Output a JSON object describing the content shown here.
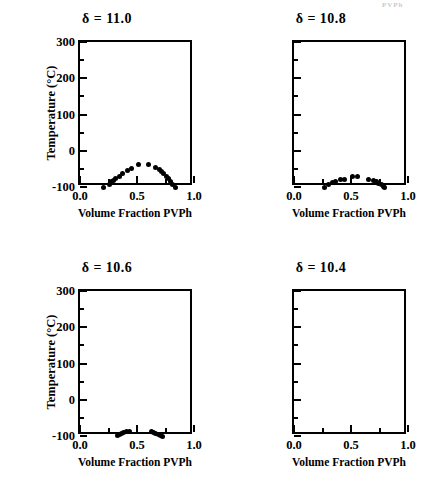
{
  "figure": {
    "artifact_text": "PVPh",
    "shared_xlabel": "Volume  Fraction  PVPh",
    "shared_ylabel": "Temperature  (°C)"
  },
  "chart_data": [
    {
      "type": "scatter",
      "title": "δ  =  11.0",
      "delta": "11.0",
      "xlabel": "Volume  Fraction  PVPh",
      "ylabel": "Temperature  (°C)",
      "xlim": [
        0.0,
        1.0
      ],
      "ylim": [
        -100,
        300
      ],
      "xticks": [
        0.0,
        0.5,
        1.0
      ],
      "xtick_labels": [
        "0.0",
        "0.5",
        "1.0"
      ],
      "xminor": [
        0.25,
        0.75
      ],
      "yticks": [
        -100,
        0,
        100,
        200,
        300
      ],
      "ytick_labels": [
        "-100",
        "0",
        "100",
        "200",
        "300"
      ],
      "yminor": [
        -50,
        50,
        150,
        250
      ],
      "grid": false,
      "legend": null,
      "x": [
        0.205,
        0.255,
        0.275,
        0.295,
        0.315,
        0.345,
        0.375,
        0.415,
        0.455,
        0.515,
        0.605,
        0.665,
        0.695,
        0.715,
        0.735,
        0.755,
        0.775,
        0.795,
        0.815,
        0.835
      ],
      "y": [
        -100,
        -93,
        -86,
        -82,
        -77,
        -70,
        -62,
        -55,
        -50,
        -38,
        -38,
        -46,
        -52,
        -58,
        -64,
        -70,
        -77,
        -84,
        -92,
        -100
      ]
    },
    {
      "type": "scatter",
      "title": "δ  =  10.8",
      "delta": "10.8",
      "xlabel": "Volume  Fraction  PVPh",
      "ylabel": "Temperature  (°C)",
      "xlim": [
        0.0,
        1.0
      ],
      "ylim": [
        -100,
        300
      ],
      "xticks": [
        0.0,
        0.5,
        1.0
      ],
      "xtick_labels": [
        "0.0",
        "0.5",
        "1.0"
      ],
      "xminor": [
        0.25,
        0.75
      ],
      "yticks": [
        -100,
        0,
        100,
        200,
        300
      ],
      "ytick_labels": [
        "-100",
        "0",
        "100",
        "200",
        "300"
      ],
      "yminor": [
        -50,
        50,
        150,
        250
      ],
      "grid": false,
      "legend": null,
      "x": [
        0.265,
        0.305,
        0.335,
        0.365,
        0.405,
        0.445,
        0.515,
        0.555,
        0.655,
        0.695,
        0.725,
        0.745,
        0.765,
        0.785,
        0.795
      ],
      "y": [
        -100,
        -94,
        -88,
        -85,
        -80,
        -78,
        -72,
        -71,
        -78,
        -82,
        -86,
        -90,
        -94,
        -98,
        -100
      ]
    },
    {
      "type": "scatter",
      "title": "δ  =  10.6",
      "delta": "10.6",
      "xlabel": "Volume  Fraction  PVPh",
      "ylabel": "Temperature  (°C)",
      "xlim": [
        0.0,
        1.0
      ],
      "ylim": [
        -100,
        300
      ],
      "xticks": [
        0.0,
        0.5,
        1.0
      ],
      "xtick_labels": [
        "0.0",
        "0.5",
        "1.0"
      ],
      "xminor": [
        0.25,
        0.75
      ],
      "yticks": [
        -100,
        0,
        100,
        200,
        300
      ],
      "ytick_labels": [
        "-100",
        "0",
        "100",
        "200",
        "300"
      ],
      "yminor": [
        -50,
        50,
        150,
        250
      ],
      "grid": false,
      "legend": null,
      "x": [
        0.325,
        0.345,
        0.365,
        0.385,
        0.405,
        0.435,
        0.625,
        0.645,
        0.665,
        0.685,
        0.705,
        0.725
      ],
      "y": [
        -99,
        -96,
        -93,
        -90,
        -88,
        -87,
        -87,
        -90,
        -93,
        -95,
        -98,
        -100
      ]
    },
    {
      "type": "scatter",
      "title": "δ  =  10.4",
      "delta": "10.4",
      "xlabel": "Volume  Fraction  PVPh",
      "ylabel": "Temperature  (°C)",
      "xlim": [
        0.0,
        1.0
      ],
      "ylim": [
        -100,
        300
      ],
      "xticks": [
        0.0,
        0.5,
        1.0
      ],
      "xtick_labels": [
        "0.0",
        "0.5",
        "1.0"
      ],
      "xminor": [
        0.25,
        0.75
      ],
      "yticks": [
        -100,
        0,
        100,
        200,
        300
      ],
      "ytick_labels": [
        "-100",
        "0",
        "100",
        "200",
        "300"
      ],
      "yminor": [
        -50,
        50,
        150,
        250
      ],
      "grid": false,
      "legend": null,
      "x": [],
      "y": []
    }
  ]
}
